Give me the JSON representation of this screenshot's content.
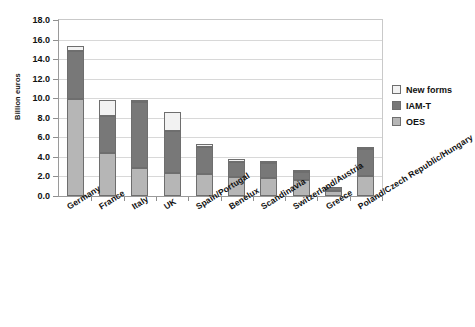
{
  "chart_data": {
    "type": "bar",
    "subtype": "stacked-vertical",
    "title": "",
    "xlabel": "",
    "ylabel": "Billion euros",
    "ylim": [
      0.0,
      18.0
    ],
    "ytick_labels": [
      "18.0",
      "16.0",
      "14.0",
      "12.0",
      "10.0",
      "8.0",
      "6.0",
      "4.0",
      "2.0",
      "0.0"
    ],
    "ytick_values": [
      18.0,
      16.0,
      14.0,
      12.0,
      10.0,
      8.0,
      6.0,
      4.0,
      2.0,
      0.0
    ],
    "grid": true,
    "grid_axis": "y",
    "legend_position": "right",
    "categories": [
      "Germany",
      "France",
      "Italy",
      "UK",
      "Spain/Portugal",
      "Benelux",
      "Scandinavia",
      "Switzerland/Austria",
      "Greece",
      "Poland/Czech Republic/Hungary"
    ],
    "series": [
      {
        "name": "OES",
        "color": "#b6b6b6",
        "values": [
          9.95,
          4.45,
          2.85,
          2.4,
          2.3,
          1.9,
          1.85,
          1.6,
          0.55,
          2.0
        ]
      },
      {
        "name": "IAM-T",
        "color": "#787878",
        "values": [
          4.85,
          3.75,
          6.8,
          4.2,
          2.75,
          1.6,
          1.5,
          0.9,
          0.35,
          2.8
        ]
      },
      {
        "name": "New forms",
        "color": "#f2f2f2",
        "values": [
          0.5,
          1.6,
          0.15,
          2.0,
          0.25,
          0.3,
          0.2,
          0.05,
          0.0,
          0.05
        ]
      }
    ],
    "totals": [
      15.3,
      9.8,
      9.8,
      8.6,
      5.3,
      3.8,
      3.55,
      2.55,
      0.9,
      4.85
    ]
  },
  "legend": {
    "items": [
      {
        "label": "New forms",
        "color": "#f2f2f2"
      },
      {
        "label": "IAM-T",
        "color": "#787878"
      },
      {
        "label": "OES",
        "color": "#b6b6b6"
      }
    ]
  },
  "colors": {
    "oes": "#b6b6b6",
    "iamt": "#787878",
    "new_forms": "#f2f2f2",
    "axis": "#9a9a9a",
    "grid": "#d8d8d8",
    "text": "#111111"
  }
}
